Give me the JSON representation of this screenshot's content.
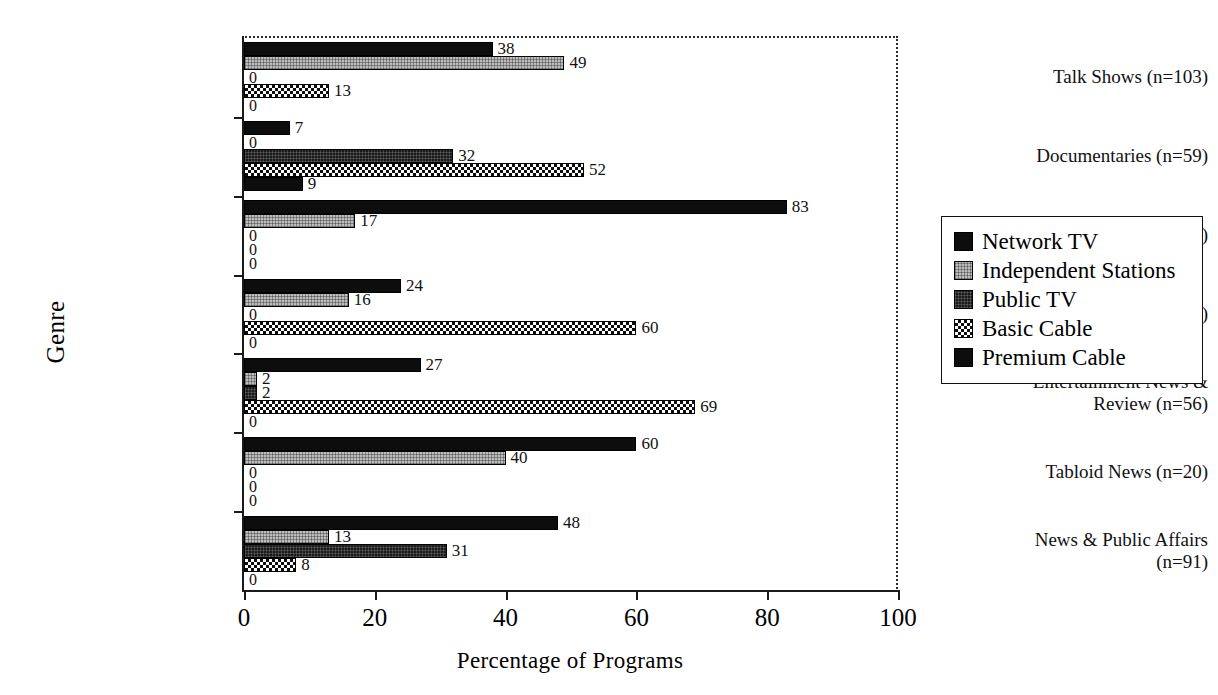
{
  "chart_data": {
    "type": "bar",
    "orientation": "horizontal",
    "title": "",
    "xlabel": "Percentage of Programs",
    "ylabel": "Genre",
    "xlim": [
      0,
      100
    ],
    "xticks": [
      "0",
      "20",
      "40",
      "60",
      "80",
      "100"
    ],
    "grid": false,
    "legend_position": "right",
    "categories": [
      "Talk Shows (n=103)",
      "Documentaries (n=59)",
      "Police Shows (n=18)",
      "Entertainment (n=37)",
      "Entertainment News & Review (n=56)",
      "Tabloid News (n=20)",
      "News & Public Affairs (n=91)"
    ],
    "series": [
      {
        "name": "Network TV",
        "values": [
          38,
          7,
          83,
          24,
          27,
          60,
          48
        ]
      },
      {
        "name": "Independent Stations",
        "values": [
          49,
          0,
          17,
          16,
          2,
          40,
          13
        ]
      },
      {
        "name": "Public TV",
        "values": [
          0,
          32,
          0,
          0,
          2,
          0,
          31
        ]
      },
      {
        "name": "Basic Cable",
        "values": [
          13,
          52,
          0,
          60,
          69,
          0,
          8
        ]
      },
      {
        "name": "Premium Cable",
        "values": [
          0,
          9,
          0,
          0,
          0,
          0,
          0
        ]
      }
    ]
  },
  "legend": {
    "items": [
      {
        "label": "Network TV"
      },
      {
        "label": "Independent Stations"
      },
      {
        "label": "Public TV"
      },
      {
        "label": "Basic Cable"
      },
      {
        "label": "Premium Cable"
      }
    ]
  },
  "axes": {
    "x_title": "Percentage of Programs",
    "y_title": "Genre"
  },
  "colors": {
    "frame": "#2b2b2b",
    "bar_outline": "#000000",
    "network_tv": "#0d0d0d",
    "independent_stations": "#bdbdbd",
    "public_tv": "#1a1a1a",
    "basic_cable": "#101010",
    "premium_cable": "#0d0d0d",
    "text": "#111111"
  }
}
